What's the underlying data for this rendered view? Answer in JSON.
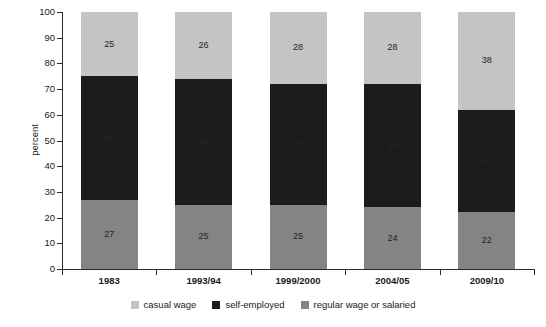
{
  "chart_data": {
    "type": "bar",
    "stacked": true,
    "title": "",
    "xlabel": "",
    "ylabel": "percent",
    "ylim": [
      0,
      100
    ],
    "yticks": [
      0,
      10,
      20,
      30,
      40,
      50,
      60,
      70,
      80,
      90,
      100
    ],
    "grid": false,
    "legend_position": "bottom",
    "categories": [
      "1983",
      "1993/94",
      "1999/2000",
      "2004/05",
      "2009/10"
    ],
    "series": [
      {
        "name": "casual wage",
        "color": "#c4c4c4",
        "values": [
          25,
          26,
          28,
          28,
          38
        ]
      },
      {
        "name": "self-employed",
        "color": "#1c1c1c",
        "values": [
          48,
          49,
          47,
          48,
          40
        ]
      },
      {
        "name": "regular wage or salaried",
        "color": "#848484",
        "values": [
          27,
          25,
          25,
          24,
          22
        ]
      }
    ],
    "stack_order_top_to_bottom": [
      "casual wage",
      "self-employed",
      "regular wage or salaried"
    ],
    "bars": [
      {
        "category": "1983",
        "casual wage": 25,
        "self-employed": 48,
        "regular wage or salaried": 27
      },
      {
        "category": "1993/94",
        "casual wage": 26,
        "self-employed": 49,
        "regular wage or salaried": 25
      },
      {
        "category": "1999/2000",
        "casual wage": 28,
        "self-employed": 47,
        "regular wage or salaried": 25
      },
      {
        "category": "2004/05",
        "casual wage": 28,
        "self-employed": 48,
        "regular wage or salaried": 24
      },
      {
        "category": "2009/10",
        "casual wage": 38,
        "self-employed": 40,
        "regular wage or salaried": 22
      }
    ]
  },
  "legend": {
    "items": [
      {
        "label": "casual wage",
        "color": "#c4c4c4"
      },
      {
        "label": "self-employed",
        "color": "#1c1c1c"
      },
      {
        "label": "regular wage or salaried",
        "color": "#848484"
      }
    ]
  }
}
